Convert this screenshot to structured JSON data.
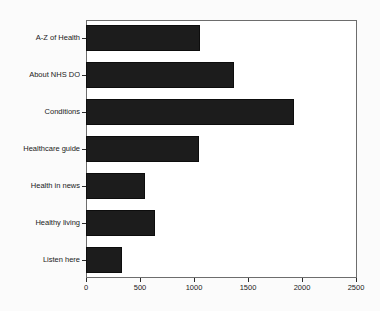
{
  "chart_data": {
    "type": "bar",
    "orientation": "horizontal",
    "title": "",
    "xlabel": "",
    "ylabel": "",
    "xlim": [
      0,
      2500
    ],
    "xticks": [
      0,
      500,
      1000,
      1500,
      2000,
      2500
    ],
    "xtick_labels": [
      "0",
      "500",
      "1000",
      "1500",
      "2000",
      "2500"
    ],
    "grid": false,
    "legend": false,
    "bar_color": "#1c1c1c",
    "categories": [
      "A-Z of Health",
      "About NHS DO",
      "Conditions",
      "Healthcare guide",
      "Health in news",
      "Healthy living",
      "Listen here"
    ],
    "values": [
      1055,
      1370,
      1925,
      1045,
      545,
      640,
      335
    ],
    "series": [
      {
        "name": "Page views",
        "values": [
          1055,
          1370,
          1925,
          1045,
          545,
          640,
          335
        ]
      }
    ]
  },
  "axis": {
    "frame_color": "#6d6d6d",
    "tick_color": "#2a2a2a",
    "label_color": "#1a1a1a"
  },
  "canvas": {
    "background": "#fbfbfb",
    "plot_background": "#ffffff"
  }
}
